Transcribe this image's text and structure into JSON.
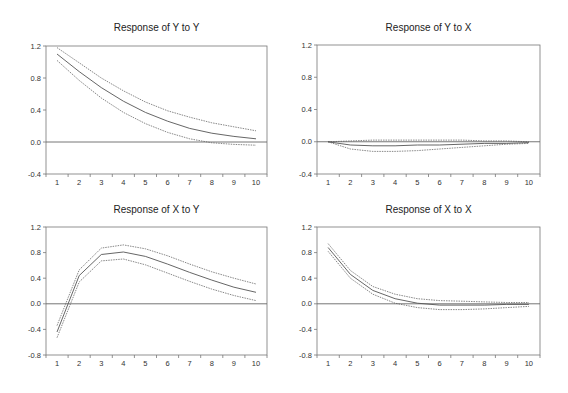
{
  "chart_data": [
    {
      "type": "line",
      "title": "Response of Y to Y",
      "x": [
        1,
        2,
        3,
        4,
        5,
        6,
        7,
        8,
        9,
        10
      ],
      "xticks": [
        "1",
        "2",
        "3",
        "4",
        "5",
        "6",
        "7",
        "8",
        "9",
        "10"
      ],
      "ylim": [
        -0.4,
        1.2
      ],
      "yticks": [
        "1.2",
        "0.8",
        "0.4",
        "0.0",
        "-0.4"
      ],
      "ytick_values": [
        1.2,
        0.8,
        0.4,
        0.0,
        -0.4
      ],
      "grid": false,
      "zero_line": true,
      "series": [
        {
          "name": "upper band",
          "style": "dashed",
          "values": [
            1.18,
            0.99,
            0.8,
            0.64,
            0.5,
            0.39,
            0.31,
            0.24,
            0.19,
            0.14
          ]
        },
        {
          "name": "response",
          "style": "solid",
          "values": [
            1.1,
            0.88,
            0.68,
            0.51,
            0.37,
            0.26,
            0.17,
            0.11,
            0.07,
            0.04
          ]
        },
        {
          "name": "lower band",
          "style": "dashed",
          "values": [
            1.02,
            0.77,
            0.55,
            0.37,
            0.23,
            0.12,
            0.04,
            -0.01,
            -0.03,
            -0.04
          ]
        }
      ]
    },
    {
      "type": "line",
      "title": "Response of Y to X",
      "x": [
        1,
        2,
        3,
        4,
        5,
        6,
        7,
        8,
        9,
        10
      ],
      "xticks": [
        "1",
        "2",
        "3",
        "4",
        "5",
        "6",
        "7",
        "8",
        "9",
        "10"
      ],
      "ylim": [
        -0.4,
        1.2
      ],
      "yticks": [
        "1.2",
        "0.8",
        "0.4",
        "0.0",
        "-0.4"
      ],
      "ytick_values": [
        1.2,
        0.8,
        0.4,
        0.0,
        -0.4
      ],
      "grid": false,
      "zero_line": true,
      "series": [
        {
          "name": "upper band",
          "style": "dashed",
          "values": [
            0.0,
            0.01,
            0.02,
            0.02,
            0.02,
            0.02,
            0.02,
            0.01,
            0.01,
            0.0
          ]
        },
        {
          "name": "response",
          "style": "solid",
          "values": [
            0.0,
            -0.04,
            -0.05,
            -0.05,
            -0.04,
            -0.04,
            -0.03,
            -0.02,
            -0.02,
            -0.01
          ]
        },
        {
          "name": "lower band",
          "style": "dashed",
          "values": [
            0.0,
            -0.09,
            -0.12,
            -0.12,
            -0.11,
            -0.09,
            -0.07,
            -0.05,
            -0.03,
            -0.02
          ]
        }
      ]
    },
    {
      "type": "line",
      "title": "Response of X to Y",
      "x": [
        1,
        2,
        3,
        4,
        5,
        6,
        7,
        8,
        9,
        10
      ],
      "xticks": [
        "1",
        "2",
        "3",
        "4",
        "5",
        "6",
        "7",
        "8",
        "9",
        "10"
      ],
      "ylim": [
        -0.8,
        1.2
      ],
      "yticks": [
        "1.2",
        "0.8",
        "0.4",
        "0.0",
        "-0.4",
        "-0.8"
      ],
      "ytick_values": [
        1.2,
        0.8,
        0.4,
        0.0,
        -0.4,
        -0.8
      ],
      "grid": false,
      "zero_line": true,
      "series": [
        {
          "name": "upper band",
          "style": "dashed",
          "values": [
            -0.34,
            0.53,
            0.87,
            0.92,
            0.86,
            0.75,
            0.62,
            0.5,
            0.4,
            0.31
          ]
        },
        {
          "name": "response",
          "style": "solid",
          "values": [
            -0.44,
            0.44,
            0.77,
            0.81,
            0.74,
            0.62,
            0.49,
            0.37,
            0.26,
            0.18
          ]
        },
        {
          "name": "lower band",
          "style": "dashed",
          "values": [
            -0.53,
            0.34,
            0.67,
            0.7,
            0.61,
            0.48,
            0.35,
            0.23,
            0.13,
            0.05
          ]
        }
      ]
    },
    {
      "type": "line",
      "title": "Response of X to X",
      "x": [
        1,
        2,
        3,
        4,
        5,
        6,
        7,
        8,
        9,
        10
      ],
      "xticks": [
        "1",
        "2",
        "3",
        "4",
        "5",
        "6",
        "7",
        "8",
        "9",
        "10"
      ],
      "ylim": [
        -0.8,
        1.2
      ],
      "yticks": [
        "1.2",
        "0.8",
        "0.4",
        "0.0",
        "-0.4",
        "-0.8"
      ],
      "ytick_values": [
        1.2,
        0.8,
        0.4,
        0.0,
        -0.4,
        -0.8
      ],
      "grid": false,
      "zero_line": true,
      "series": [
        {
          "name": "upper band",
          "style": "dashed",
          "values": [
            0.94,
            0.52,
            0.27,
            0.15,
            0.08,
            0.05,
            0.04,
            0.03,
            0.02,
            0.02
          ]
        },
        {
          "name": "response",
          "style": "solid",
          "values": [
            0.88,
            0.46,
            0.21,
            0.08,
            0.01,
            -0.02,
            -0.02,
            -0.02,
            -0.01,
            -0.01
          ]
        },
        {
          "name": "lower band",
          "style": "dashed",
          "values": [
            0.82,
            0.4,
            0.15,
            0.01,
            -0.06,
            -0.09,
            -0.09,
            -0.08,
            -0.06,
            -0.04
          ]
        }
      ]
    }
  ],
  "panels": [
    {
      "title": "Response of Y to Y"
    },
    {
      "title": "Response of Y to X"
    },
    {
      "title": "Response of X to Y"
    },
    {
      "title": "Response of X to X"
    }
  ],
  "colors": {
    "line": "#555555",
    "axis": "#777777",
    "zero_line": "#666666",
    "text": "#222222"
  }
}
